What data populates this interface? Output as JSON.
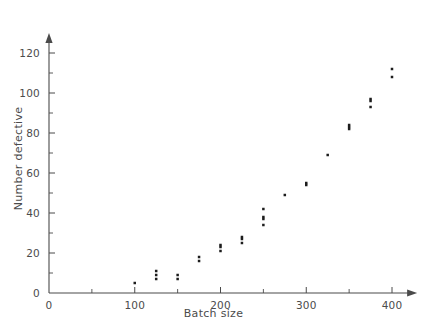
{
  "chart_data": {
    "type": "scatter",
    "title": "",
    "xlabel": "Batch size",
    "ylabel": "Number defective",
    "xlim": [
      0,
      420
    ],
    "ylim": [
      0,
      126
    ],
    "grid": false,
    "legend": "none",
    "x_ticks": [
      0,
      100,
      200,
      300,
      400
    ],
    "x_tick_labels": [
      "0",
      "100",
      "200",
      "300",
      "400"
    ],
    "x_minor_ticks": [
      50,
      150,
      250,
      350
    ],
    "y_ticks": [
      0,
      20,
      40,
      60,
      80,
      100,
      120
    ],
    "y_tick_labels": [
      "0",
      "20",
      "40",
      "60",
      "80",
      "100",
      "120"
    ],
    "y_minor_ticks": [
      10,
      30,
      50,
      70,
      90,
      110
    ],
    "marker": "dot",
    "marker_color": "#1d1d1d",
    "axis_color": "#4a4a4a",
    "points": [
      {
        "x": 100,
        "y": 5
      },
      {
        "x": 125,
        "y": 11
      },
      {
        "x": 125,
        "y": 9
      },
      {
        "x": 125,
        "y": 7
      },
      {
        "x": 150,
        "y": 9
      },
      {
        "x": 150,
        "y": 7
      },
      {
        "x": 175,
        "y": 18
      },
      {
        "x": 175,
        "y": 16
      },
      {
        "x": 200,
        "y": 24
      },
      {
        "x": 200,
        "y": 23
      },
      {
        "x": 200,
        "y": 21
      },
      {
        "x": 225,
        "y": 28
      },
      {
        "x": 225,
        "y": 27
      },
      {
        "x": 225,
        "y": 25
      },
      {
        "x": 250,
        "y": 42
      },
      {
        "x": 250,
        "y": 38
      },
      {
        "x": 250,
        "y": 37
      },
      {
        "x": 250,
        "y": 34
      },
      {
        "x": 275,
        "y": 49
      },
      {
        "x": 300,
        "y": 55
      },
      {
        "x": 300,
        "y": 54
      },
      {
        "x": 325,
        "y": 69
      },
      {
        "x": 350,
        "y": 84
      },
      {
        "x": 350,
        "y": 83
      },
      {
        "x": 350,
        "y": 82
      },
      {
        "x": 375,
        "y": 97
      },
      {
        "x": 375,
        "y": 96
      },
      {
        "x": 375,
        "y": 93
      },
      {
        "x": 400,
        "y": 112
      },
      {
        "x": 400,
        "y": 108
      }
    ]
  },
  "axes": {
    "x_origin_px": 49,
    "y_origin_px": 293,
    "x_scale_px_per_unit": 0.8575,
    "y_scale_px_per_unit": 2.0
  }
}
